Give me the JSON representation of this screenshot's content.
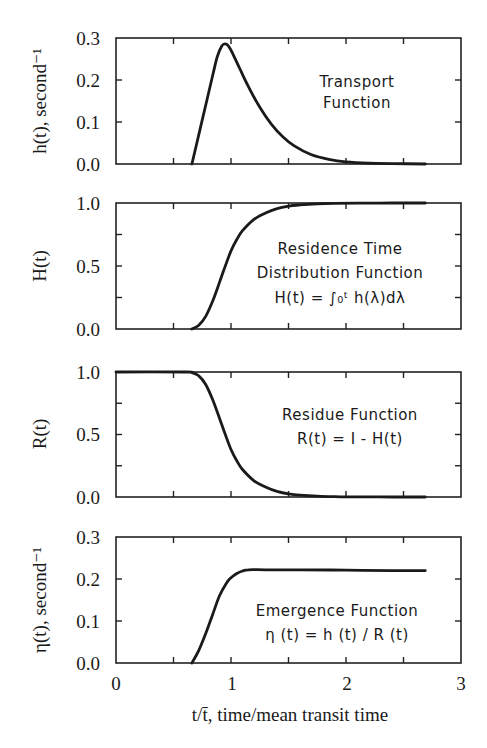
{
  "figure": {
    "x_axis": {
      "label": "t/t̄, time/mean transit time",
      "ticks": [
        "0",
        "1",
        "2",
        "3"
      ],
      "range": [
        0,
        3
      ]
    }
  },
  "chart_data": [
    {
      "type": "line",
      "title": "Transport Function",
      "annotation": [
        "Transport",
        "Function"
      ],
      "ylabel": "h(t), second⁻¹",
      "xlabel": "t/t̄, time/mean transit time",
      "xlim": [
        0,
        3
      ],
      "ylim": [
        0,
        0.3
      ],
      "yticks": [
        "0.0",
        "0.1",
        "0.2",
        "0.3"
      ],
      "grid": false,
      "series": [
        {
          "name": "h(t)",
          "x": [
            0.66,
            0.72,
            0.78,
            0.84,
            0.88,
            0.92,
            0.95,
            0.98,
            1.02,
            1.08,
            1.15,
            1.25,
            1.35,
            1.45,
            1.55,
            1.7,
            1.85,
            2.0,
            2.2,
            2.4,
            2.69
          ],
          "y": [
            0.0,
            0.07,
            0.14,
            0.21,
            0.255,
            0.281,
            0.286,
            0.28,
            0.26,
            0.225,
            0.185,
            0.135,
            0.095,
            0.065,
            0.043,
            0.022,
            0.011,
            0.005,
            0.002,
            0.001,
            0.0
          ]
        }
      ]
    },
    {
      "type": "line",
      "title": "Residence Time Distribution Function",
      "annotation": [
        "Residence Time",
        "Distribution Function",
        "H(t) = ∫₀ᵗ h(λ)dλ"
      ],
      "ylabel": "H(t)",
      "xlabel": "t/t̄, time/mean transit time",
      "xlim": [
        0,
        3
      ],
      "ylim": [
        0,
        1.0
      ],
      "yticks": [
        "0.0",
        "0.5",
        "1.0"
      ],
      "grid": false,
      "series": [
        {
          "name": "H(t)",
          "x": [
            0.66,
            0.72,
            0.78,
            0.84,
            0.9,
            0.95,
            1.0,
            1.05,
            1.1,
            1.2,
            1.3,
            1.4,
            1.5,
            1.6,
            1.75,
            1.9,
            2.1,
            2.4,
            2.69
          ],
          "y": [
            0.0,
            0.03,
            0.1,
            0.22,
            0.37,
            0.5,
            0.62,
            0.71,
            0.78,
            0.87,
            0.92,
            0.955,
            0.975,
            0.985,
            0.993,
            0.997,
            0.999,
            1.0,
            1.0
          ]
        }
      ]
    },
    {
      "type": "line",
      "title": "Residue Function",
      "annotation": [
        "Residue Function",
        "R(t) = I - H(t)"
      ],
      "ylabel": "R(t)",
      "xlabel": "t/t̄, time/mean transit time",
      "xlim": [
        0,
        3
      ],
      "ylim": [
        0,
        1.0
      ],
      "yticks": [
        "0.0",
        "0.5",
        "1.0"
      ],
      "grid": false,
      "series": [
        {
          "name": "R(t)",
          "x": [
            0.0,
            0.6,
            0.66,
            0.72,
            0.78,
            0.84,
            0.9,
            0.95,
            1.0,
            1.05,
            1.1,
            1.2,
            1.3,
            1.4,
            1.5,
            1.6,
            1.75,
            1.9,
            2.1,
            2.4,
            2.69
          ],
          "y": [
            1.0,
            1.0,
            0.995,
            0.97,
            0.9,
            0.78,
            0.63,
            0.5,
            0.38,
            0.29,
            0.22,
            0.13,
            0.08,
            0.045,
            0.025,
            0.015,
            0.007,
            0.003,
            0.001,
            0.0,
            0.0
          ]
        }
      ]
    },
    {
      "type": "line",
      "title": "Emergence Function",
      "annotation": [
        "Emergence Function",
        "η (t) = h (t) / R (t)"
      ],
      "ylabel": "η(t), second⁻¹",
      "xlabel": "t/t̄, time/mean transit time",
      "xlim": [
        0,
        3
      ],
      "ylim": [
        0,
        0.3
      ],
      "xticks": [
        "0",
        "1",
        "2",
        "3"
      ],
      "yticks": [
        "0.0",
        "0.1",
        "0.2",
        "0.3"
      ],
      "grid": false,
      "series": [
        {
          "name": "η(t)",
          "x": [
            0.66,
            0.72,
            0.78,
            0.84,
            0.9,
            0.96,
            1.0,
            1.05,
            1.1,
            1.15,
            1.3,
            1.6,
            2.0,
            2.4,
            2.69
          ],
          "y": [
            0.0,
            0.03,
            0.07,
            0.115,
            0.16,
            0.19,
            0.203,
            0.213,
            0.219,
            0.222,
            0.222,
            0.222,
            0.221,
            0.22,
            0.22
          ]
        }
      ]
    }
  ]
}
